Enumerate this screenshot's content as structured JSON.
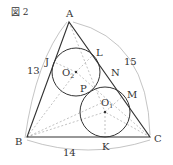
{
  "figure": {
    "title": "図 2",
    "vertices": {
      "A": "A",
      "B": "B",
      "C": "C"
    },
    "points": {
      "J": "J",
      "L": "L",
      "N": "N",
      "M": "M",
      "P": "P",
      "K": "K"
    },
    "centers": {
      "upper": "O",
      "upper_sub": "2",
      "lower": "O",
      "lower_sub": "1"
    },
    "side_lengths": {
      "AB": "13",
      "AC": "15",
      "BC": "14"
    },
    "colors": {
      "line": "#333333",
      "dashed": "#999999",
      "arc": "#aaaaaa"
    }
  }
}
